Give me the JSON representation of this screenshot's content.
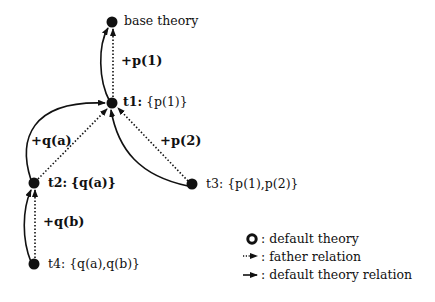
{
  "diagram": {
    "nodes": [
      {
        "id": "base",
        "name": "base theory",
        "set": "",
        "x": 112,
        "y": 22
      },
      {
        "id": "t1",
        "name": "t1:",
        "set": "{p(1)}",
        "x": 112,
        "y": 103
      },
      {
        "id": "t2",
        "name": "t2:",
        "set": "{q(a)}",
        "x": 34,
        "y": 183
      },
      {
        "id": "t3",
        "name": "t3:",
        "set": "{p(1),p(2)}",
        "x": 192,
        "y": 184
      },
      {
        "id": "t4",
        "name": "t4:",
        "set": "{q(a),q(b)}",
        "x": 34,
        "y": 264
      }
    ],
    "edges": [
      {
        "from": "t1",
        "to": "base",
        "label": "+p(1)",
        "father": true
      },
      {
        "from": "t2",
        "to": "t1",
        "label": "+q(a)",
        "father": true
      },
      {
        "from": "t3",
        "to": "t1",
        "label": "+p(2)",
        "father": true
      },
      {
        "from": "t4",
        "to": "t2",
        "label": "+q(b)",
        "father": true
      }
    ],
    "default_theory_relations": [
      {
        "from": "t1",
        "to": "base"
      },
      {
        "from": "t2",
        "to": "t1"
      },
      {
        "from": "t3",
        "to": "t1"
      },
      {
        "from": "t4",
        "to": "t2"
      }
    ]
  },
  "labels": {
    "base": "base theory",
    "t1_name": "t1:",
    "t1_set": "{p(1)}",
    "t2_name": "t2:",
    "t2_set": "{q(a)}",
    "t3_name": "t3:",
    "t3_set": "{p(1),p(2)}",
    "t4_name": "t4:",
    "t4_set": "{q(a),q(b)}",
    "edge_t1_base": "+p(1)",
    "edge_t2_t1": "+q(a)",
    "edge_t3_t1": "+p(2)",
    "edge_t4_t2": "+q(b)"
  },
  "legend": {
    "items": [
      {
        "icon": "filled-circle-icon",
        "label": ": default theory"
      },
      {
        "icon": "dotted-arrow-icon",
        "label": ": father relation"
      },
      {
        "icon": "solid-arrow-icon",
        "label": ": default theory relation"
      }
    ]
  },
  "colors": {
    "ink": "#111111",
    "background": "#ffffff"
  }
}
